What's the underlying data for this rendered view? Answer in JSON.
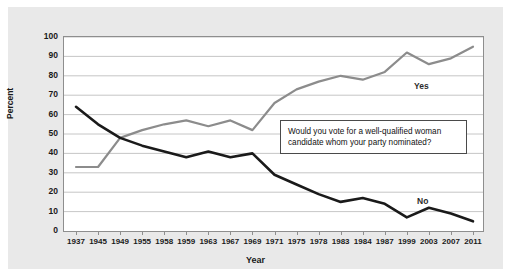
{
  "chart_data": {
    "type": "line",
    "title": "",
    "subtitle": "",
    "xlabel": "Year",
    "ylabel": "Percent",
    "ylim": [
      0,
      100
    ],
    "ytick_step": 10,
    "yticks": [
      0,
      10,
      20,
      30,
      40,
      50,
      60,
      70,
      80,
      90,
      100
    ],
    "grid": "horizontal",
    "legend_position": "inline-series-labels",
    "categories": [
      "1937",
      "1945",
      "1949",
      "1955",
      "1958",
      "1959",
      "1963",
      "1967",
      "1969",
      "1971",
      "1975",
      "1978",
      "1983",
      "1984",
      "1987",
      "1999",
      "2003",
      "2007",
      "2011"
    ],
    "series": [
      {
        "name": "Yes",
        "color": "#8c8c8c",
        "values": [
          33,
          33,
          48,
          52,
          55,
          57,
          54,
          57,
          52,
          66,
          73,
          77,
          80,
          78,
          82,
          92,
          86,
          89,
          95
        ]
      },
      {
        "name": "No",
        "color": "#1a1a1a",
        "values": [
          64,
          55,
          48,
          44,
          41,
          38,
          41,
          38,
          40,
          29,
          24,
          19,
          15,
          17,
          14,
          7,
          12,
          9,
          5
        ]
      }
    ],
    "annotations": [
      {
        "name": "question-callout",
        "text": "Would you vote for a well-qualified woman candidate whom your party nominated?"
      }
    ]
  },
  "series_labels": {
    "yes": "Yes",
    "no": "No"
  },
  "colors": {
    "panel_background": "#e9e9e9",
    "plot_background": "#ffffff",
    "grid": "#b8b8b8",
    "axis": "#8e8e8e",
    "yes_line": "#8c8c8c",
    "no_line": "#1a1a1a",
    "text": "#1a1a1a"
  }
}
